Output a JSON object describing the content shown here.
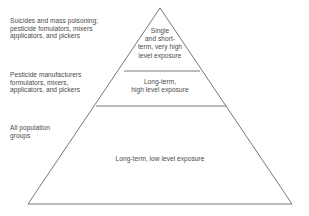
{
  "diagram": {
    "type": "pyramid",
    "title": "",
    "background_color": "#ffffff",
    "line_color": "#555555",
    "text_color": "#4a4a4a",
    "tiers": [
      {
        "level": 1,
        "position": "top",
        "exposure_label": "Single\nand short-\nterm, very high\nlevel exposure",
        "population_label": "Suicides and mass poisoning;\npesticide fomulators, mixers\napplicators, and pickers"
      },
      {
        "level": 2,
        "position": "middle",
        "exposure_label": "Long-term,\nhigh level exposure",
        "population_label": "Pesticide manufacturers\nformulators, mixers,\napplicators, and pickers"
      },
      {
        "level": 3,
        "position": "base",
        "exposure_label": "Long-term, low level exposure",
        "population_label": "All population\ngroups"
      }
    ]
  }
}
